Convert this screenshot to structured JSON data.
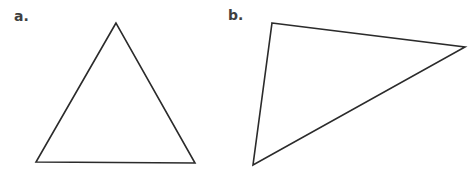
{
  "figure": {
    "panels": [
      {
        "label": "a.",
        "shape": "triangle",
        "description": "equilateral-like triangle",
        "vertices": [
          [
            116,
            23
          ],
          [
            36,
            162
          ],
          [
            195,
            163
          ]
        ]
      },
      {
        "label": "b.",
        "shape": "triangle",
        "description": "scalene triangle",
        "vertices": [
          [
            272,
            23
          ],
          [
            465,
            47
          ],
          [
            253,
            165
          ]
        ]
      }
    ],
    "stroke_color": "#2b2b2b",
    "label_color": "#3f3f3f"
  }
}
